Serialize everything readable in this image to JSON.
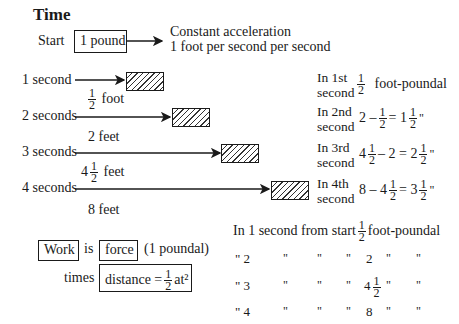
{
  "title": "Time",
  "start": {
    "label": "Start",
    "mass_box": "1 pound",
    "note_line1": "Constant acceleration",
    "note_line2": "1 foot per second per second"
  },
  "rows": [
    {
      "time": "1 second",
      "distance_whole": "",
      "distance_num": "1",
      "distance_den": "2",
      "distance_unit": "foot"
    },
    {
      "time": "2 seconds",
      "distance_whole": "2",
      "distance_unit": "feet"
    },
    {
      "time": "3 seconds",
      "distance_whole": "4",
      "distance_num": "1",
      "distance_den": "2",
      "distance_unit": "feet"
    },
    {
      "time": "4 seconds",
      "distance_whole": "8",
      "distance_unit": "feet"
    }
  ],
  "per_second": [
    {
      "line1": "In 1st",
      "line2": "second",
      "expr_num": "1",
      "expr_den": "2",
      "unit": "foot-poundal"
    },
    {
      "line1": "In 2nd",
      "line2": "second",
      "expr_a": "2 –",
      "frac_num": "1",
      "frac_den": "2",
      "expr_b": "= 1",
      "res_num": "1",
      "res_den": "2",
      "ditto": "\""
    },
    {
      "line1": "In 3rd",
      "line2": "second",
      "expr_a": "4",
      "frac_num": "1",
      "frac_den": "2",
      "expr_b": "– 2 = 2",
      "res_num": "1",
      "res_den": "2",
      "ditto": "\""
    },
    {
      "line1": "In 4th",
      "line2": "second",
      "expr_a": "8 – 4",
      "frac_num": "1",
      "frac_den": "2",
      "expr_b": "= 3",
      "res_num": "1",
      "res_den": "2",
      "ditto": "\""
    }
  ],
  "formula": {
    "work": "Work",
    "is": "is",
    "force": "force",
    "force_note": "(1 poundal)",
    "times": "times",
    "distance_prefix": "distance =",
    "distance_num": "1",
    "distance_den": "2",
    "distance_suffix": "at²"
  },
  "cumulative": {
    "header_prefix": "In 1 second from start",
    "header_num": "1",
    "header_den": "2",
    "header_unit": "foot-poundal",
    "rows": [
      {
        "c1": "\" 2",
        "c2": "\"",
        "c3": "\"",
        "c4": "\"",
        "value": "2",
        "c5": "\"",
        "c6": "\""
      },
      {
        "c1": "\" 3",
        "c2": "\"",
        "c3": "\"",
        "c4": "\"",
        "value": "4",
        "value_num": "1",
        "value_den": "2",
        "c5": "\"",
        "c6": "\""
      },
      {
        "c1": "\" 4",
        "c2": "\"",
        "c3": "\"",
        "c4": "\"",
        "value": "8",
        "c5": "\"",
        "c6": "\""
      }
    ]
  }
}
